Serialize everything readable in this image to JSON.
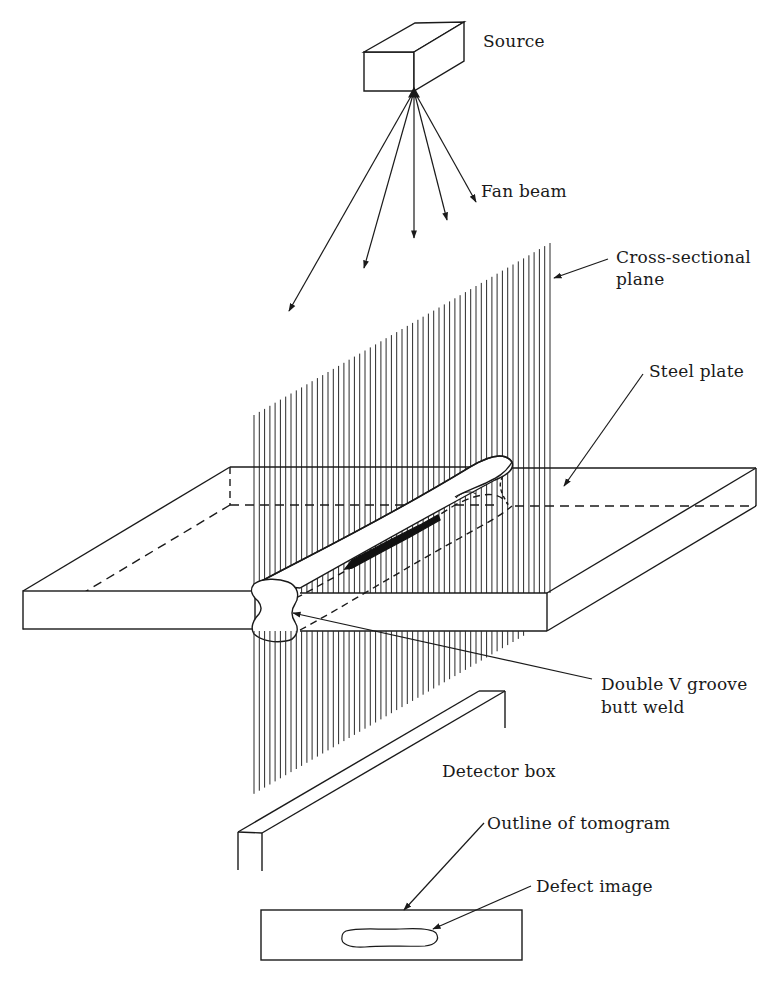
{
  "figure": {
    "labels": {
      "source": "Source",
      "fan_beam": "Fan beam",
      "cross_sectional_plane_line1": "Cross-sectional",
      "cross_sectional_plane_line2": "plane",
      "steel_plate": "Steel plate",
      "weld_line1": "Double V groove",
      "weld_line2": "butt weld",
      "detector_box": "Detector box",
      "tomogram_outline": "Outline of tomogram",
      "defect_image": "Defect image"
    },
    "colors": {
      "ink": "#1a1a1a",
      "background": "#ffffff",
      "defect_fill": "#111111"
    },
    "fan_beam_ray_count": 5,
    "plane_hatch_line_count": 57
  }
}
